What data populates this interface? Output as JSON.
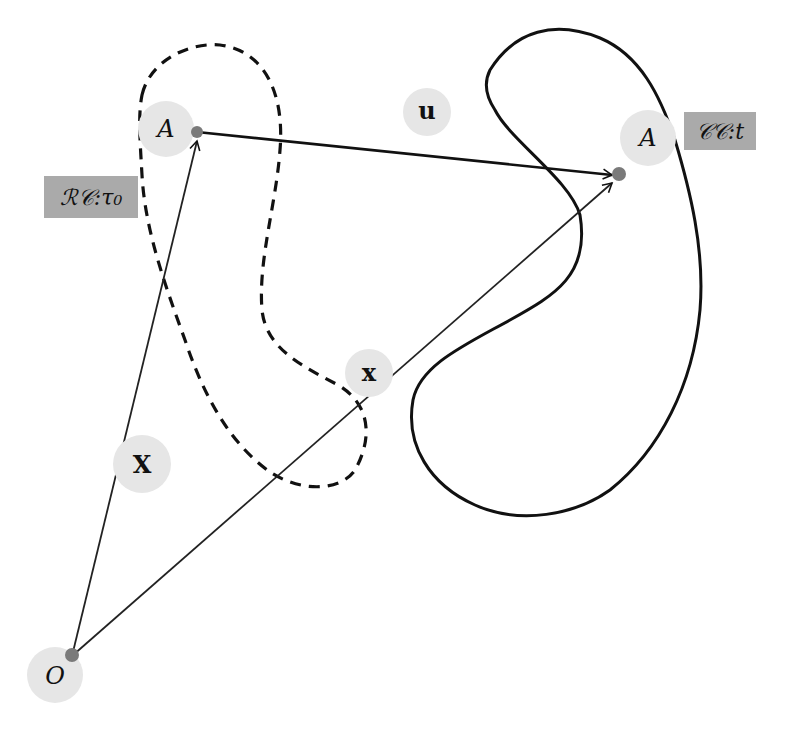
{
  "diagram": {
    "colors": {
      "background": "#ffffff",
      "bubble_fill": "#e6e6e6",
      "tag_fill": "#aaaaaa",
      "point_fill": "#7a7a7a",
      "line": "#111111"
    },
    "points": {
      "origin": {
        "label": "O"
      },
      "reference_point": {
        "label": "A"
      },
      "current_point": {
        "label": "A"
      }
    },
    "vectors": {
      "reference_position": {
        "label": "X"
      },
      "current_position": {
        "label": "x"
      },
      "displacement": {
        "label": "u"
      }
    },
    "configurations": {
      "reference": {
        "label": "ℛ𝒞:τ₀",
        "style": "dashed"
      },
      "current": {
        "label": "𝒞𝒞:t",
        "style": "solid"
      }
    }
  }
}
